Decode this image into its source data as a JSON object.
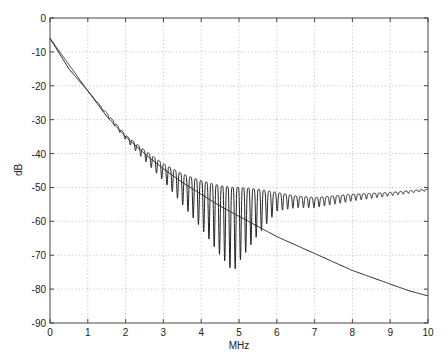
{
  "chart_data": {
    "type": "line",
    "title": "",
    "xlabel": "MHz",
    "ylabel": "dB",
    "xlim": [
      0,
      10
    ],
    "ylim": [
      -90,
      0
    ],
    "grid": true,
    "legend": null,
    "x_ticks": [
      "0",
      "1",
      "2",
      "3",
      "4",
      "5",
      "6",
      "7",
      "8",
      "9",
      "10"
    ],
    "y_ticks": [
      "0",
      "-10",
      "-20",
      "-30",
      "-40",
      "-50",
      "-60",
      "-70",
      "-80",
      "-90"
    ],
    "series": [
      {
        "name": "smooth-rolloff",
        "description": "Monotonic decaying response",
        "x": [
          0,
          0.5,
          1,
          1.5,
          2,
          2.5,
          3,
          3.5,
          4,
          4.5,
          5,
          5.5,
          6,
          6.5,
          7,
          7.5,
          8,
          8.5,
          9,
          9.5,
          10
        ],
        "values": [
          -6,
          -15,
          -21.5,
          -29,
          -35,
          -40,
          -44.5,
          -48.5,
          -52,
          -55.5,
          -58.5,
          -61.5,
          -64.5,
          -67,
          -69.5,
          -72,
          -74.5,
          -76.5,
          -78.5,
          -80.5,
          -82
        ]
      },
      {
        "name": "oscillating-response",
        "description": "Rippled response with deep nulls near 5 MHz, envelope upper ~-48 to -51 dB",
        "x": [
          0,
          1,
          2,
          2.5,
          3,
          3.5,
          4,
          4.5,
          4.85,
          5,
          5.5,
          6,
          6.5,
          7,
          7.5,
          8,
          9,
          10
        ],
        "upper_envelope": [
          -6,
          -21.5,
          -34.5,
          -39,
          -43,
          -46,
          -48,
          -49.5,
          -50,
          -50,
          -50.5,
          -51.5,
          -52.5,
          -53,
          -52.5,
          -52,
          -51.5,
          -50.5
        ],
        "lower_envelope": [
          -6,
          -21.5,
          -36,
          -42,
          -48,
          -55,
          -62,
          -70,
          -75,
          -72,
          -64,
          -57,
          -56,
          -56,
          -55,
          -54,
          -52.5,
          -51
        ],
        "min_point": {
          "x": 4.85,
          "y": -75
        }
      }
    ]
  }
}
